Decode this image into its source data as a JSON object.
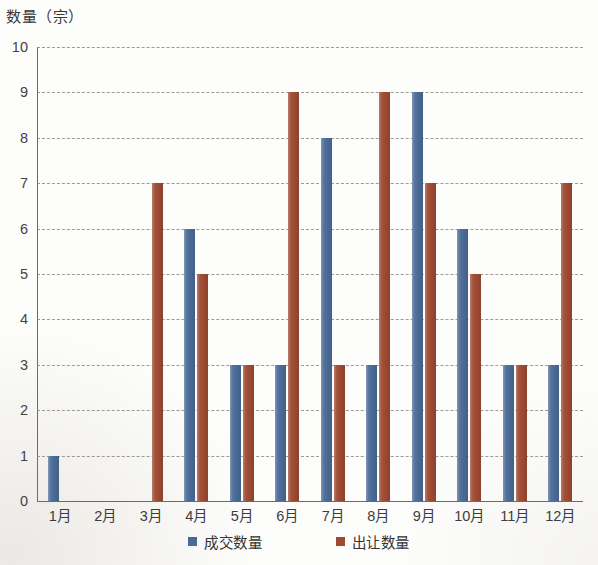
{
  "chart_data": {
    "type": "bar",
    "title": "",
    "subtitle": "",
    "xlabel": "",
    "ylabel": "数量（宗）",
    "categories": [
      "1月",
      "2月",
      "3月",
      "4月",
      "5月",
      "6月",
      "7月",
      "8月",
      "9月",
      "10月",
      "11月",
      "12月"
    ],
    "series": [
      {
        "name": "成交数量",
        "color": "#4a6a96",
        "values": [
          1,
          0,
          0,
          6,
          3,
          3,
          8,
          3,
          9,
          6,
          3,
          3
        ]
      },
      {
        "name": "出让数量",
        "color": "#9e4a32",
        "values": [
          0,
          0,
          7,
          5,
          3,
          9,
          3,
          9,
          7,
          5,
          3,
          7
        ]
      }
    ],
    "ylim": [
      0,
      10
    ],
    "ytick_step": 1,
    "ytick_labels": [
      "0",
      "1",
      "2",
      "3",
      "4",
      "5",
      "6",
      "7",
      "8",
      "9",
      "10"
    ],
    "grid": true,
    "grid_style": "dashed-horizontal",
    "grid_color": "#8d8a84",
    "legend_position": "bottom-center",
    "background_color": "#ffffff"
  },
  "axis": {
    "y_title": "数量（宗）"
  },
  "legend": {
    "items": [
      {
        "label": "成交数量",
        "swatch": "legend-swatch-blue"
      },
      {
        "label": "出让数量",
        "swatch": "legend-swatch-red"
      }
    ]
  }
}
